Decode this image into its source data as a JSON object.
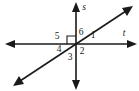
{
  "figure": {
    "type": "geometry-diagram",
    "background_color": "#ffffff",
    "stroke_color": "#1a1a1a",
    "width": 139,
    "height": 91,
    "intersection": {
      "x": 76,
      "y": 44
    },
    "lines": [
      {
        "name": "s",
        "label": "s",
        "label_style": "italic",
        "label_x": 84,
        "label_y": 8,
        "orientation": "vertical",
        "x1": 76,
        "y1": 7,
        "x2": 76,
        "y2": 85,
        "arrows": "both"
      },
      {
        "name": "t",
        "label": "t",
        "label_style": "italic",
        "label_x": 124,
        "label_y": 34,
        "orientation": "horizontal",
        "x1": 9,
        "y1": 44,
        "x2": 133,
        "y2": 44,
        "arrows": "both"
      },
      {
        "name": "diagonal",
        "label": "",
        "label_style": "none",
        "orientation": "diagonal",
        "x1": 17,
        "y1": 83,
        "x2": 129,
        "y2": 9,
        "arrows": "both"
      }
    ],
    "right_angle_marker": {
      "present": true,
      "quadrant": "upper-left",
      "x": 67,
      "y": 36,
      "size": 8
    },
    "angle_labels": [
      {
        "id": "angle-1",
        "text": "1",
        "x": 93,
        "y": 36
      },
      {
        "id": "angle-2",
        "text": "2",
        "x": 82,
        "y": 52
      },
      {
        "id": "angle-3",
        "text": "3",
        "x": 70,
        "y": 58
      },
      {
        "id": "angle-4",
        "text": "4",
        "x": 59,
        "y": 50
      },
      {
        "id": "angle-5",
        "text": "5",
        "x": 57,
        "y": 37
      },
      {
        "id": "angle-6",
        "text": "6",
        "x": 81,
        "y": 33
      }
    ]
  }
}
